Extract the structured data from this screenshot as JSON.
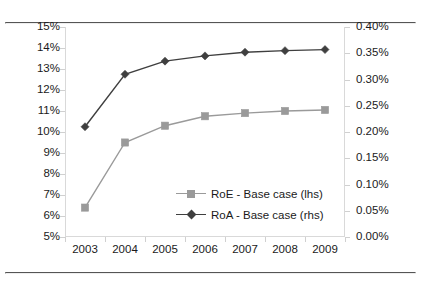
{
  "chart_data": {
    "type": "line",
    "title": "",
    "subtitle": "",
    "xlabel": "",
    "ylabel": "",
    "grid": false,
    "legend_position": "inside-center-lower",
    "categories": [
      "2003",
      "2004",
      "2005",
      "2006",
      "2007",
      "2008",
      "2009"
    ],
    "axes": {
      "left": {
        "label": "",
        "ylim": [
          5,
          15
        ],
        "tick_step": 1,
        "ticks": [
          15,
          14,
          13,
          12,
          11,
          10,
          9,
          8,
          7,
          6,
          5
        ],
        "tick_labels": [
          "15%",
          "14%",
          "13%",
          "12%",
          "11%",
          "10%",
          "9%",
          "8%",
          "7%",
          "6%",
          "5%"
        ]
      },
      "right": {
        "label": "",
        "ylim": [
          0.0,
          0.4
        ],
        "tick_step": 0.05,
        "ticks": [
          0.4,
          0.35,
          0.3,
          0.25,
          0.2,
          0.15,
          0.1,
          0.05,
          0.0
        ],
        "tick_labels": [
          "0.40%",
          "0.35%",
          "0.30%",
          "0.25%",
          "0.20%",
          "0.15%",
          "0.10%",
          "0.05%",
          "0.00%"
        ]
      }
    },
    "series": [
      {
        "name": "RoE - Base case (lhs)",
        "axis": "left",
        "color": "#9a9a9a",
        "marker": "square",
        "values": [
          6.4,
          9.5,
          10.3,
          10.75,
          10.9,
          11.0,
          11.05
        ]
      },
      {
        "name": "RoA - Base case (rhs)",
        "axis": "right",
        "color": "#3f3f3f",
        "marker": "diamond",
        "values": [
          0.21,
          0.31,
          0.335,
          0.345,
          0.352,
          0.355,
          0.357
        ]
      }
    ]
  },
  "legend": {
    "items": [
      {
        "label": "RoE - Base case (lhs)",
        "color": "#9a9a9a",
        "marker": "square"
      },
      {
        "label": "RoA - Base case (rhs)",
        "color": "#3f3f3f",
        "marker": "diamond"
      }
    ]
  },
  "colors": {
    "roe": "#9a9a9a",
    "roa": "#3f3f3f",
    "axis": "#d0d0d0",
    "rule": "#555555",
    "text": "#1a1a1a",
    "background": "#ffffff"
  }
}
